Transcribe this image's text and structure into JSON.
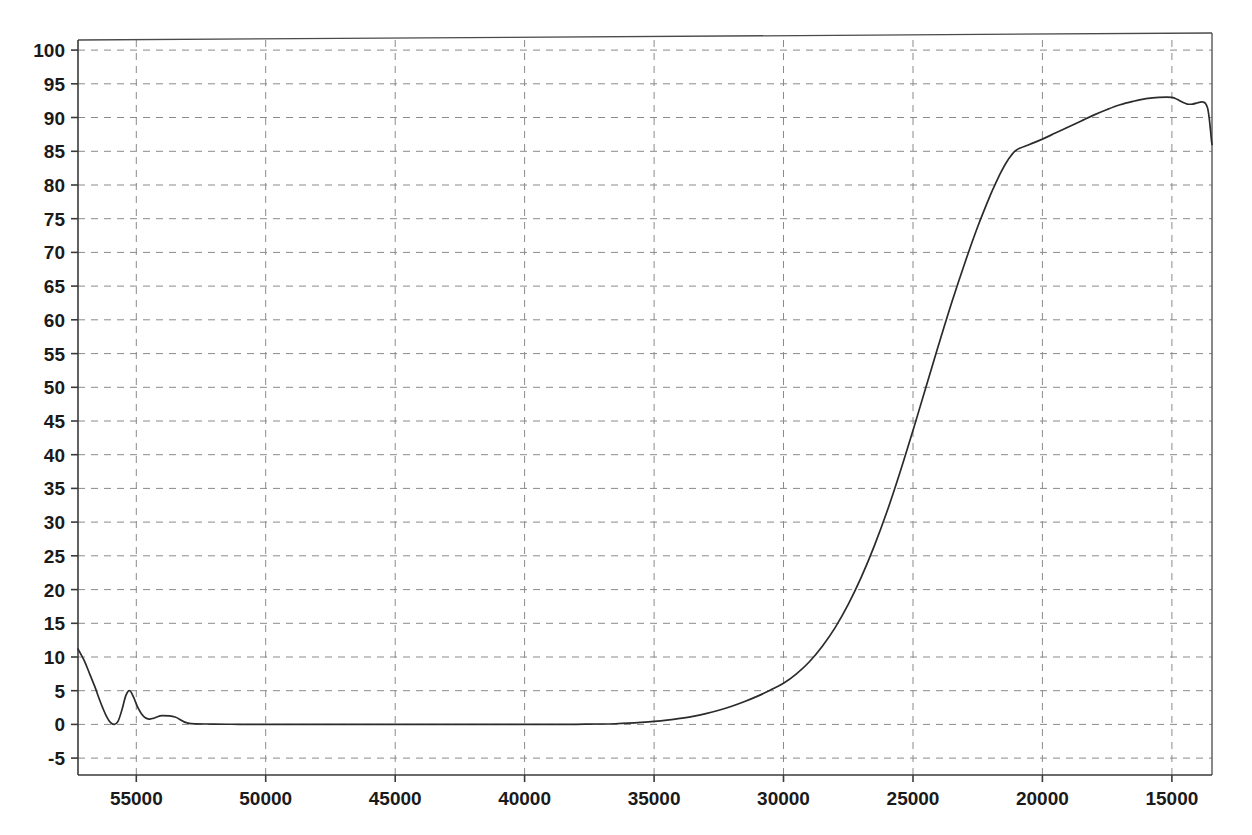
{
  "chart_data": {
    "type": "line",
    "title": "",
    "subtitle": "",
    "xlabel": "",
    "ylabel": "",
    "xlim": [
      57250,
      13450
    ],
    "ylim": [
      -7.5,
      101.5
    ],
    "x_axis_reversed": true,
    "grid": true,
    "grid_style": "dashed",
    "legend": "none",
    "xticks": [
      55000,
      50000,
      45000,
      40000,
      35000,
      30000,
      25000,
      20000,
      15000
    ],
    "xtick_labels": [
      "55000",
      "50000",
      "45000",
      "40000",
      "35000",
      "30000",
      "25000",
      "20000",
      "15000"
    ],
    "yticks": [
      -5,
      0,
      5,
      10,
      15,
      20,
      25,
      30,
      35,
      40,
      45,
      50,
      55,
      60,
      65,
      70,
      75,
      80,
      85,
      90,
      95,
      100
    ],
    "ytick_labels": [
      "-5",
      "0",
      "5",
      "10",
      "15",
      "20",
      "25",
      "30",
      "35",
      "40",
      "45",
      "50",
      "55",
      "60",
      "65",
      "70",
      "75",
      "80",
      "85",
      "90",
      "95",
      "100"
    ],
    "line_color": "#2b2b2b",
    "grid_color": "#8a8a8a",
    "series": [
      {
        "name": "transmission",
        "x": [
          57250,
          57000,
          56800,
          56600,
          56450,
          56300,
          56150,
          56000,
          55850,
          55700,
          55550,
          55400,
          55250,
          55100,
          54950,
          54800,
          54650,
          54500,
          54350,
          54200,
          54000,
          53500,
          53000,
          52000,
          51000,
          50000,
          49000,
          48000,
          47000,
          46000,
          45000,
          44000,
          43000,
          42000,
          41000,
          40000,
          39000,
          38000,
          37000,
          36500,
          36000,
          35500,
          35000,
          34500,
          34000,
          33500,
          33000,
          32500,
          32000,
          31500,
          31000,
          30500,
          30000,
          29500,
          29000,
          28500,
          28000,
          27500,
          27000,
          26500,
          26000,
          25500,
          25000,
          24500,
          24000,
          23500,
          23000,
          22500,
          22000,
          21800,
          21600,
          21400,
          21200,
          21000,
          20500,
          20000,
          19500,
          19000,
          18500,
          18000,
          17500,
          17000,
          16500,
          16000,
          15500,
          15000,
          14800,
          14600,
          14400,
          14200,
          14000,
          13900,
          13800,
          13700,
          13620,
          13560,
          13510,
          13470,
          13450
        ],
        "y": [
          11.2,
          9.4,
          7.5,
          5.6,
          4.0,
          2.5,
          1.2,
          0.3,
          0.0,
          0.5,
          2.2,
          4.3,
          5.0,
          4.0,
          2.6,
          1.6,
          1.0,
          0.8,
          0.9,
          1.1,
          1.3,
          1.1,
          0.2,
          0.05,
          0.02,
          0.0,
          0.0,
          0.0,
          0.0,
          0.0,
          0.0,
          0.0,
          0.0,
          0.0,
          0.0,
          0.0,
          0.0,
          0.02,
          0.06,
          0.1,
          0.18,
          0.3,
          0.45,
          0.65,
          0.9,
          1.2,
          1.6,
          2.1,
          2.7,
          3.4,
          4.2,
          5.1,
          6.1,
          7.5,
          9.3,
          11.6,
          14.4,
          17.8,
          21.8,
          26.4,
          31.6,
          37.4,
          43.6,
          50.0,
          56.4,
          62.6,
          68.4,
          73.8,
          78.6,
          80.3,
          81.9,
          83.3,
          84.4,
          85.2,
          86.0,
          86.8,
          87.7,
          88.6,
          89.5,
          90.4,
          91.2,
          91.9,
          92.4,
          92.8,
          93.0,
          93.0,
          92.7,
          92.3,
          92.0,
          92.0,
          92.2,
          92.3,
          92.3,
          92.1,
          91.4,
          90.0,
          88.2,
          86.6,
          86.0
        ]
      }
    ]
  },
  "axes": {
    "top_border_note": "plot frame",
    "bottom_border_note": "plot frame"
  }
}
